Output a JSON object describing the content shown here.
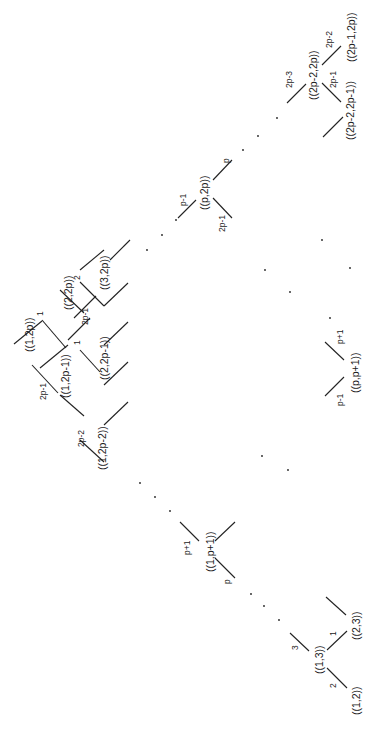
{
  "diagram": {
    "orientation": "rotated 90deg counter-clockwise",
    "nodes": [
      {
        "id": "n12",
        "label": "((1,2))"
      },
      {
        "id": "n13",
        "label": "((1,3))"
      },
      {
        "id": "n23",
        "label": "((2,3))"
      },
      {
        "id": "n1p1",
        "label": "((1,p+1))"
      },
      {
        "id": "n12p2",
        "label": "((1,2p-2))"
      },
      {
        "id": "n12p1",
        "label": "((1,2p-1))"
      },
      {
        "id": "n12p",
        "label": "((1,2p))"
      },
      {
        "id": "n22p1",
        "label": "((2,2p-1))"
      },
      {
        "id": "n22p",
        "label": "((2,2p))"
      },
      {
        "id": "n32p",
        "label": "((3,2p))"
      },
      {
        "id": "npp1",
        "label": "((p,p+1))"
      },
      {
        "id": "np2p",
        "label": "((p,2p))"
      },
      {
        "id": "n2p22p1",
        "label": "((2p-2,2p-1))"
      },
      {
        "id": "n2p22p",
        "label": "((2p-2,2p))"
      },
      {
        "id": "n2p12p",
        "label": "((2p-1,2p))"
      }
    ],
    "edge_labels": {
      "e2": "2",
      "e3": "3",
      "e1": "1",
      "ep": "p",
      "ep1": "p+1",
      "e2p2": "2p-2",
      "e2p1": "2p-1",
      "e1b": "1",
      "e1c": "1",
      "e2p1b": "2p-1",
      "e2b": "2",
      "epm1": "p-1",
      "epp1": "p+1",
      "epm1b": "p-1",
      "epb": "p",
      "e2p1c": "2p-1",
      "e2p3": "2p-3",
      "e2p1d": "2p-1",
      "e2p2b": "2p-2"
    }
  }
}
